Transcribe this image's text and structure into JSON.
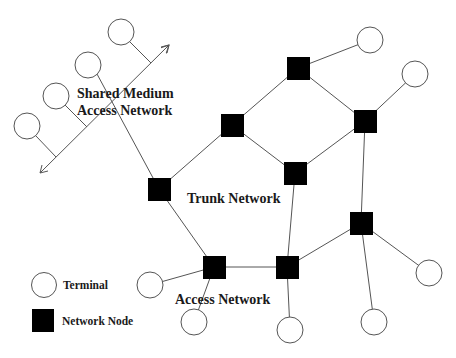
{
  "labels": {
    "shared_medium_line1": "Shared Medium",
    "shared_medium_line2": "Access Network",
    "trunk_network": "Trunk Network",
    "access_network": "Access Network"
  },
  "legend": {
    "terminal": "Terminal",
    "network_node": "Network Node"
  },
  "colors": {
    "node": "#000000",
    "line": "#555555",
    "background": "#ffffff"
  },
  "diagram": {
    "network_nodes": [
      {
        "id": "N1",
        "x": 298,
        "y": 68
      },
      {
        "id": "N2",
        "x": 232,
        "y": 125
      },
      {
        "id": "N3",
        "x": 365,
        "y": 121
      },
      {
        "id": "N4",
        "x": 295,
        "y": 173
      },
      {
        "id": "N5",
        "x": 159,
        "y": 189
      },
      {
        "id": "N6",
        "x": 214,
        "y": 267
      },
      {
        "id": "N7",
        "x": 287,
        "y": 267
      },
      {
        "id": "N8",
        "x": 361,
        "y": 223
      }
    ],
    "terminals": [
      {
        "id": "T1",
        "x": 121,
        "y": 32
      },
      {
        "id": "T2",
        "x": 88,
        "y": 65
      },
      {
        "id": "T3",
        "x": 56,
        "y": 96
      },
      {
        "id": "T4",
        "x": 27,
        "y": 126
      },
      {
        "id": "T5",
        "x": 370,
        "y": 40
      },
      {
        "id": "T6",
        "x": 415,
        "y": 74
      },
      {
        "id": "T7",
        "x": 150,
        "y": 285
      },
      {
        "id": "T8",
        "x": 194,
        "y": 322
      },
      {
        "id": "T9",
        "x": 290,
        "y": 330
      },
      {
        "id": "T10",
        "x": 374,
        "y": 322
      },
      {
        "id": "T11",
        "x": 429,
        "y": 273
      }
    ],
    "links": [
      [
        "T5",
        "N1"
      ],
      [
        "N1",
        "N2"
      ],
      [
        "N1",
        "N3"
      ],
      [
        "N2",
        "N4"
      ],
      [
        "N3",
        "N4"
      ],
      [
        "N2",
        "N5"
      ],
      [
        "N3",
        "T6"
      ],
      [
        "N3",
        "N8"
      ],
      [
        "N4",
        "N7"
      ],
      [
        "N5",
        "N6"
      ],
      [
        "N6",
        "N7"
      ],
      [
        "N6",
        "T7"
      ],
      [
        "N6",
        "T8"
      ],
      [
        "N7",
        "N8"
      ],
      [
        "N7",
        "T9"
      ],
      [
        "N8",
        "T10"
      ],
      [
        "N8",
        "T11"
      ],
      [
        "T2",
        "N5"
      ]
    ],
    "shared_bus": {
      "from": [
        40,
        173
      ],
      "to": [
        169,
        45
      ],
      "bidirectional_arrow": true
    }
  }
}
